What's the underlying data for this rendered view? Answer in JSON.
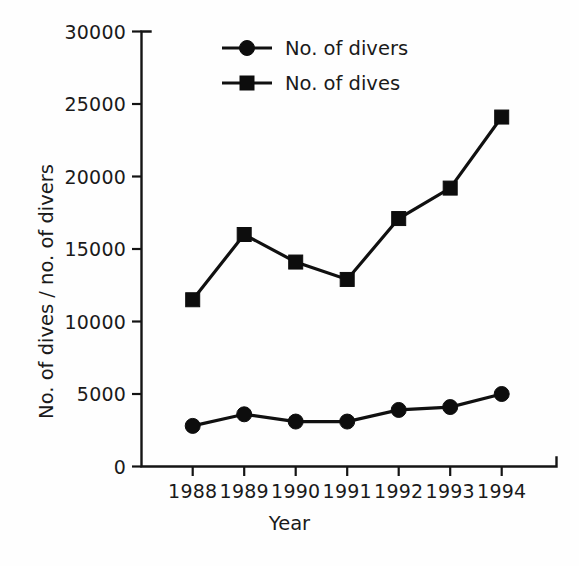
{
  "chart_data": {
    "type": "line",
    "title": "",
    "xlabel": "Year",
    "ylabel": "No. of dives / no. of divers",
    "categories": [
      "1988",
      "1989",
      "1990",
      "1991",
      "1992",
      "1993",
      "1994"
    ],
    "x": [
      1988,
      1989,
      1990,
      1991,
      1992,
      1993,
      1994
    ],
    "series": [
      {
        "name": "No. of divers",
        "marker": "circle",
        "color": "#0d0d0d",
        "values": [
          2800,
          3600,
          3100,
          3100,
          3900,
          4100,
          5000
        ]
      },
      {
        "name": "No. of dives",
        "marker": "square",
        "color": "#0d0d0d",
        "values": [
          11500,
          16000,
          14100,
          12900,
          17100,
          19200,
          24100
        ]
      }
    ],
    "ylim": [
      0,
      30000
    ],
    "yticks": [
      0,
      5000,
      10000,
      15000,
      20000,
      25000,
      30000
    ],
    "ytick_labels": [
      "0",
      "5000",
      "10000",
      "15000",
      "20000",
      "25000",
      "30000"
    ],
    "xtick_labels": [
      "1988",
      "1989",
      "1990",
      "1991",
      "1992",
      "1993",
      "1994"
    ],
    "grid": false,
    "legend_position": "top-center",
    "legend": [
      "No. of divers",
      "No. of dives"
    ]
  }
}
